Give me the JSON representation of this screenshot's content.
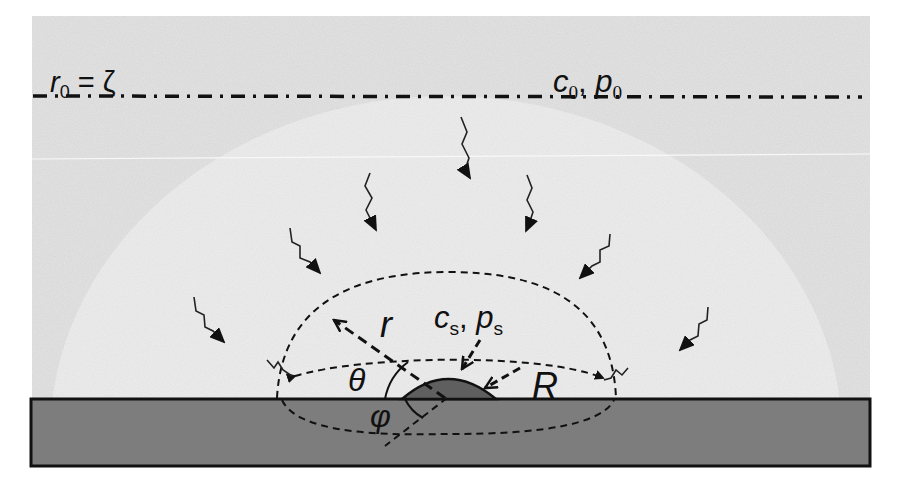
{
  "diagram": {
    "type": "physical schematic",
    "colors": {
      "background_outer": "#e4e4e4",
      "halo": "#f0f0f0",
      "substrate": "#7d7d7d",
      "droplet": "#5f5f5f",
      "ink": "#111111",
      "page": "#ffffff"
    },
    "labels": {
      "boundary": {
        "main": "r",
        "sub": "0",
        "rest": " = ζ"
      },
      "far_field": {
        "c": "c",
        "c_sub": "0",
        "sep": ", ",
        "p": "p",
        "p_sub": "0"
      },
      "surface": {
        "c": "c",
        "c_sub": "s",
        "sep": ", ",
        "p": "p",
        "p_sub": "s"
      },
      "radius_r": "r",
      "radius_R": "R",
      "angle_theta": "θ",
      "angle_phi": "φ"
    },
    "elements": [
      {
        "name": "far-field-boundary",
        "style": "dash-dot line",
        "y": 97
      },
      {
        "name": "hemispherical-control-surface",
        "style": "dashed"
      },
      {
        "name": "equatorial-ellipse",
        "style": "dashed"
      },
      {
        "name": "sessile-droplet",
        "style": "filled cap"
      },
      {
        "name": "substrate",
        "style": "filled rectangle"
      },
      {
        "name": "diffusion-arrows",
        "count": 9,
        "style": "zigzag arrows pointing inward"
      }
    ]
  }
}
